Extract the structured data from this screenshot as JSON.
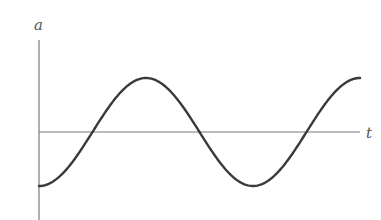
{
  "chart_data": {
    "type": "line",
    "title": "",
    "xlabel": "t",
    "ylabel": "a",
    "grid": false,
    "legend": null,
    "series": [
      {
        "name": "a(t)",
        "function": "-cos",
        "description": "Sinusoid starting at a minimum at t=0, rising through zero, reaching a maximum, falling to a minimum, and rising to a maximum at the right edge (about 1.5 periods).",
        "x": [
          0,
          0.25,
          0.5,
          0.75,
          1.0,
          1.25,
          1.5
        ],
        "y": [
          -1,
          0,
          1,
          0,
          -1,
          0,
          1
        ]
      }
    ],
    "x_unit": "periods",
    "y_unit": "amplitude",
    "ylim": [
      -1,
      1
    ]
  },
  "labels": {
    "y_axis": "a",
    "x_axis": "t"
  },
  "style": {
    "curve_color": "#3a3a3a",
    "axis_color": "#777777"
  }
}
